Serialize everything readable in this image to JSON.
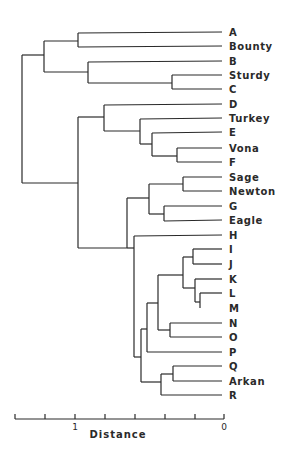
{
  "chart_data": {
    "type": "dendrogram",
    "title": "",
    "xlabel": "Distance",
    "ylabel": "",
    "axis": {
      "direction": "reversed",
      "range": [
        1.4,
        0
      ],
      "tick_step": 0.2,
      "ticks": [
        1.4,
        1.2,
        1.0,
        0.8,
        0.6,
        0.4,
        0.2,
        0.0
      ],
      "tick_labels": [
        {
          "value": 1.0,
          "label": "1"
        },
        {
          "value": 0.0,
          "label": "0"
        }
      ],
      "grid": false
    },
    "leaves": [
      "A",
      "Bounty",
      "B",
      "Sturdy",
      "C",
      "D",
      "Turkey",
      "E",
      "Vona",
      "F",
      "Sage",
      "Newton",
      "G",
      "Eagle",
      "H",
      "I",
      "J",
      "K",
      "L",
      "M",
      "N",
      "O",
      "P",
      "Q",
      "Arkan",
      "R"
    ],
    "merges": [
      {
        "children": [
          "Sturdy",
          "C"
        ],
        "height": 0.34
      },
      {
        "children": [
          "Vona",
          "F"
        ],
        "height": 0.31
      },
      {
        "children": [
          "Sage",
          "Newton"
        ],
        "height": 0.27
      },
      {
        "children": [
          "L",
          "M"
        ],
        "height": 0.16
      },
      {
        "children": [
          "K",
          "LM"
        ],
        "height": 0.19
      },
      {
        "children": [
          "I",
          "J"
        ],
        "height": 0.21
      },
      {
        "children": [
          "IJ",
          "KLM"
        ],
        "height": 0.28
      },
      {
        "children": [
          "N",
          "O"
        ],
        "height": 0.36
      },
      {
        "children": [
          "Q",
          "Arkan"
        ],
        "height": 0.34
      },
      {
        "children": [
          "G",
          "Eagle"
        ],
        "height": 0.4
      },
      {
        "children": [
          "E",
          "VonaF"
        ],
        "height": 0.48
      },
      {
        "children": [
          "Turkey",
          "EVonaF"
        ],
        "height": 0.56
      },
      {
        "children": [
          "IJKLM",
          "NO"
        ],
        "height": 0.44
      },
      {
        "children": [
          "QArkan",
          "R"
        ],
        "height": 0.42
      },
      {
        "children": [
          "SageNewton",
          "GEagle"
        ],
        "height": 0.5
      },
      {
        "children": [
          "IJKLMNO",
          "P"
        ],
        "height": 0.52
      },
      {
        "children": [
          "IJKLMNOP",
          "QArkanR"
        ],
        "height": 0.56
      },
      {
        "children": [
          "H",
          "IJKLMNOPQArkanR"
        ],
        "height": 0.6
      },
      {
        "children": [
          "SageNewtonGEagle",
          "H-R"
        ],
        "height": 0.65
      },
      {
        "children": [
          "A",
          "Bounty"
        ],
        "height": 0.97
      },
      {
        "children": [
          "B",
          "SturdyC"
        ],
        "height": 0.91
      },
      {
        "children": [
          "D",
          "TurkeyEVonaF"
        ],
        "height": 0.81
      },
      {
        "children": [
          "D-F",
          "Sage-R"
        ],
        "height": 0.98
      },
      {
        "children": [
          "ABounty",
          "BSturdyC"
        ],
        "height": 1.21
      },
      {
        "children": [
          "A-C",
          "D-R"
        ],
        "height": 1.35
      }
    ]
  },
  "layout": {
    "leaf_y": [
      32,
      46,
      61,
      75,
      89,
      104,
      118,
      132,
      148,
      162,
      177,
      191,
      206,
      220,
      235,
      249,
      264,
      279,
      293,
      308,
      323,
      337,
      352,
      366,
      381,
      395
    ],
    "leaf_x_end": 222,
    "label_x": 229,
    "axis": {
      "y": 419,
      "x0": 15,
      "x1": 224,
      "tick_xs": [
        15,
        45,
        75,
        105,
        135,
        165,
        195,
        224
      ],
      "label_1_x": 75,
      "label_0_x": 224,
      "title_x": 118,
      "title_y": 438
    },
    "segments": [
      [
        22,
        55,
        22,
        183
      ],
      [
        22,
        55,
        44,
        55
      ],
      [
        22,
        183,
        78,
        183
      ],
      [
        44,
        41,
        44,
        72
      ],
      [
        44,
        41,
        78,
        41
      ],
      [
        44,
        72,
        88,
        72
      ],
      [
        78,
        33,
        78,
        47
      ],
      [
        78,
        33,
        222,
        32
      ],
      [
        78,
        47,
        222,
        46
      ],
      [
        88,
        62,
        88,
        83
      ],
      [
        88,
        62,
        222,
        61
      ],
      [
        88,
        83,
        172,
        83
      ],
      [
        172,
        75,
        172,
        89
      ],
      [
        172,
        75,
        222,
        75
      ],
      [
        172,
        89,
        222,
        89
      ],
      [
        78,
        117,
        78,
        248
      ],
      [
        78,
        117,
        104,
        117
      ],
      [
        78,
        248,
        127,
        248
      ],
      [
        104,
        105,
        104,
        131
      ],
      [
        104,
        105,
        222,
        104
      ],
      [
        104,
        131,
        140,
        131
      ],
      [
        140,
        119,
        140,
        144
      ],
      [
        140,
        119,
        222,
        118
      ],
      [
        140,
        144,
        152,
        144
      ],
      [
        152,
        133,
        152,
        156
      ],
      [
        152,
        133,
        222,
        132
      ],
      [
        152,
        156,
        177,
        156
      ],
      [
        177,
        148,
        177,
        162
      ],
      [
        177,
        148,
        222,
        148
      ],
      [
        177,
        162,
        222,
        162
      ],
      [
        127,
        198,
        127,
        248
      ],
      [
        127,
        198,
        149,
        198
      ],
      [
        149,
        184,
        149,
        214
      ],
      [
        149,
        184,
        183,
        184
      ],
      [
        149,
        214,
        164,
        214
      ],
      [
        183,
        177,
        183,
        191
      ],
      [
        183,
        177,
        222,
        177
      ],
      [
        183,
        191,
        222,
        191
      ],
      [
        164,
        206,
        164,
        221
      ],
      [
        164,
        206,
        222,
        206
      ],
      [
        164,
        221,
        222,
        220
      ],
      [
        127,
        248,
        134,
        248
      ],
      [
        134,
        236,
        134,
        357
      ],
      [
        134,
        236,
        222,
        235
      ],
      [
        134,
        357,
        141,
        357
      ],
      [
        141,
        329,
        141,
        382
      ],
      [
        141,
        329,
        147,
        329
      ],
      [
        141,
        382,
        161,
        382
      ],
      [
        147,
        303,
        147,
        352
      ],
      [
        147,
        303,
        158,
        303
      ],
      [
        147,
        352,
        222,
        352
      ],
      [
        158,
        275,
        158,
        330
      ],
      [
        158,
        275,
        183,
        275
      ],
      [
        158,
        330,
        170,
        330
      ],
      [
        183,
        257,
        183,
        288
      ],
      [
        183,
        257,
        193,
        257
      ],
      [
        183,
        288,
        195,
        288
      ],
      [
        193,
        249,
        193,
        264
      ],
      [
        193,
        249,
        222,
        249
      ],
      [
        193,
        264,
        222,
        264
      ],
      [
        195,
        279,
        195,
        302
      ],
      [
        195,
        279,
        222,
        279
      ],
      [
        195,
        302,
        200,
        302
      ],
      [
        200,
        293,
        200,
        308
      ],
      [
        200,
        293,
        222,
        293
      ],
      [
        170,
        323,
        170,
        337
      ],
      [
        170,
        323,
        222,
        323
      ],
      [
        170,
        337,
        222,
        337
      ],
      [
        161,
        374,
        161,
        395
      ],
      [
        161,
        374,
        173,
        374
      ],
      [
        161,
        395,
        222,
        395
      ],
      [
        173,
        366,
        173,
        381
      ],
      [
        173,
        366,
        222,
        366
      ],
      [
        173,
        381,
        222,
        381
      ]
    ]
  }
}
